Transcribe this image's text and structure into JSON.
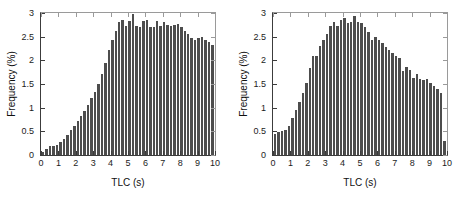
{
  "figure": {
    "background_color": "#ffffff",
    "bar_color": "#4d4d4d",
    "axis_color": "#3c3c3c",
    "panel_count": 2
  },
  "artifacts": {
    "ghost_left": "Figure: scanned page background text",
    "ghost_right": "scanned page background text"
  },
  "chart_data": [
    {
      "type": "bar",
      "title": "",
      "subtitle": "",
      "panel": "left",
      "xlabel": "TLC (s)",
      "ylabel": "Frequency (%)",
      "xlim": [
        0,
        10
      ],
      "ylim": [
        0,
        3
      ],
      "xticks": [
        0,
        1,
        2,
        3,
        4,
        5,
        6,
        7,
        8,
        9,
        10
      ],
      "xticklabels": [
        "0",
        "1",
        "2",
        "3",
        "4",
        "5",
        "6",
        "7",
        "8",
        "9",
        "10"
      ],
      "yticks": [
        0,
        0.5,
        1,
        1.5,
        2,
        2.5,
        3
      ],
      "yticklabels": [
        "0",
        "0.5",
        "1",
        "1.5",
        "2",
        "2.5",
        "3"
      ],
      "grid": false,
      "legend": null,
      "bin_width": 0.2,
      "x": [
        0.1,
        0.3,
        0.5,
        0.7,
        0.9,
        1.1,
        1.3,
        1.5,
        1.7,
        1.9,
        2.1,
        2.3,
        2.5,
        2.7,
        2.9,
        3.1,
        3.3,
        3.5,
        3.7,
        3.9,
        4.1,
        4.3,
        4.5,
        4.7,
        4.9,
        5.1,
        5.3,
        5.5,
        5.7,
        5.9,
        6.1,
        6.3,
        6.5,
        6.7,
        6.9,
        7.1,
        7.3,
        7.5,
        7.7,
        7.9,
        8.1,
        8.3,
        8.5,
        8.7,
        8.9,
        9.1,
        9.3,
        9.5,
        9.7,
        9.9
      ],
      "values": [
        0.06,
        0.12,
        0.18,
        0.2,
        0.22,
        0.27,
        0.33,
        0.42,
        0.52,
        0.62,
        0.72,
        0.82,
        0.93,
        1.05,
        1.2,
        1.33,
        1.5,
        1.72,
        1.95,
        2.22,
        2.42,
        2.62,
        2.82,
        2.85,
        2.72,
        2.83,
        2.98,
        2.72,
        2.7,
        2.84,
        2.86,
        2.7,
        2.71,
        2.83,
        2.72,
        2.8,
        2.75,
        2.73,
        2.75,
        2.76,
        2.7,
        2.62,
        2.56,
        2.48,
        2.44,
        2.48,
        2.49,
        2.42,
        2.38,
        2.33
      ]
    },
    {
      "type": "bar",
      "title": "",
      "subtitle": "",
      "panel": "right",
      "xlabel": "TLC (s)",
      "ylabel": "Frequency (%)",
      "xlim": [
        0,
        10
      ],
      "ylim": [
        0,
        3
      ],
      "xticks": [
        0,
        1,
        2,
        3,
        4,
        5,
        6,
        7,
        8,
        9,
        10
      ],
      "xticklabels": [
        "0",
        "1",
        "2",
        "3",
        "4",
        "5",
        "6",
        "7",
        "8",
        "9",
        "10"
      ],
      "yticks": [
        0,
        0.5,
        1,
        1.5,
        2,
        2.5,
        3
      ],
      "yticklabels": [
        "0",
        "0.5",
        "1",
        "1.5",
        "2",
        "2.5",
        "3"
      ],
      "grid": false,
      "legend": null,
      "bin_width": 0.2,
      "x": [
        0.1,
        0.3,
        0.5,
        0.7,
        0.9,
        1.1,
        1.3,
        1.5,
        1.7,
        1.9,
        2.1,
        2.3,
        2.5,
        2.7,
        2.9,
        3.1,
        3.3,
        3.5,
        3.7,
        3.9,
        4.1,
        4.3,
        4.5,
        4.7,
        4.9,
        5.1,
        5.3,
        5.5,
        5.7,
        5.9,
        6.1,
        6.3,
        6.5,
        6.7,
        6.9,
        7.1,
        7.3,
        7.5,
        7.7,
        7.9,
        8.1,
        8.3,
        8.5,
        8.7,
        8.9,
        9.1,
        9.3,
        9.5,
        9.7,
        9.9
      ],
      "values": [
        0.44,
        0.48,
        0.5,
        0.52,
        0.62,
        0.78,
        0.95,
        1.12,
        1.3,
        1.52,
        1.83,
        2.1,
        2.1,
        2.3,
        2.44,
        2.55,
        2.72,
        2.8,
        2.72,
        2.85,
        2.9,
        2.78,
        2.8,
        2.94,
        2.8,
        2.78,
        2.7,
        2.6,
        2.44,
        2.5,
        2.42,
        2.36,
        2.28,
        2.22,
        2.15,
        2.1,
        2.06,
        1.78,
        1.86,
        1.8,
        1.62,
        1.72,
        1.6,
        1.58,
        1.6,
        1.52,
        1.46,
        1.4,
        1.32,
        0.3
      ]
    }
  ]
}
